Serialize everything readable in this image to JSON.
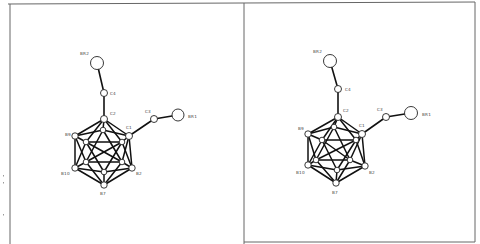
{
  "figure": {
    "type": "stereo-pair ORTEP molecular structure",
    "molecule": "bis(bromomethyl) ortho-carborane",
    "colors": {
      "bond": "#111111",
      "atom_fill": "#ffffff",
      "atom_stroke": "#222222",
      "frame": "#666666",
      "label": "#444444"
    }
  },
  "frame": {
    "top": [
      [
        8,
        4
      ],
      [
        475,
        2
      ]
    ],
    "left": [
      [
        10,
        4
      ],
      [
        10,
        244
      ]
    ],
    "divider": [
      [
        244,
        3
      ],
      [
        244,
        244
      ]
    ],
    "right": [
      [
        475,
        2
      ],
      [
        475,
        242
      ]
    ],
    "bottom_right": [
      [
        244,
        242
      ],
      [
        475,
        242
      ]
    ]
  },
  "margin_marks": [
    [
      3,
      175
    ],
    [
      3,
      182
    ],
    [
      3,
      214
    ]
  ],
  "panels": [
    {
      "name": "left-view",
      "atoms": [
        {
          "id": "BR2",
          "x": 97,
          "y": 63,
          "r": 6.5,
          "label": "BR2",
          "lx": 80,
          "ly": 55
        },
        {
          "id": "C4",
          "x": 104,
          "y": 93,
          "r": 3.5,
          "label": "C4",
          "lx": 110,
          "ly": 95
        },
        {
          "id": "C2",
          "x": 104,
          "y": 119,
          "r": 3.5,
          "label": "C2",
          "lx": 110,
          "ly": 115
        },
        {
          "id": "C3",
          "x": 154,
          "y": 119,
          "r": 3.5,
          "label": "C3",
          "lx": 145,
          "ly": 113
        },
        {
          "id": "BR1",
          "x": 178,
          "y": 115,
          "r": 6.0,
          "label": "BR1",
          "lx": 188,
          "ly": 118
        },
        {
          "id": "C1",
          "x": 129,
          "y": 136,
          "r": 3.5,
          "label": "C1",
          "lx": 126,
          "ly": 129
        },
        {
          "id": "B9",
          "x": 75,
          "y": 136,
          "r": 3.2,
          "label": "B9",
          "lx": 65,
          "ly": 136
        },
        {
          "id": "B10",
          "x": 75,
          "y": 168,
          "r": 3.2,
          "label": "B10",
          "lx": 61,
          "ly": 175
        },
        {
          "id": "B2",
          "x": 132,
          "y": 168,
          "r": 3.2,
          "label": "B2",
          "lx": 136,
          "ly": 175
        },
        {
          "id": "B7",
          "x": 104,
          "y": 185,
          "r": 3.2,
          "label": "B7",
          "lx": 100,
          "ly": 195
        },
        {
          "id": "i1",
          "x": 103,
          "y": 130,
          "r": 2.8,
          "label": "",
          "lx": 0,
          "ly": 0
        },
        {
          "id": "i2",
          "x": 86,
          "y": 142,
          "r": 2.8,
          "label": "",
          "lx": 0,
          "ly": 0
        },
        {
          "id": "i3",
          "x": 122,
          "y": 142,
          "r": 2.8,
          "label": "",
          "lx": 0,
          "ly": 0
        },
        {
          "id": "i4",
          "x": 86,
          "y": 162,
          "r": 2.8,
          "label": "",
          "lx": 0,
          "ly": 0
        },
        {
          "id": "i5",
          "x": 122,
          "y": 162,
          "r": 2.8,
          "label": "",
          "lx": 0,
          "ly": 0
        },
        {
          "id": "i6",
          "x": 104,
          "y": 172,
          "r": 2.8,
          "label": "",
          "lx": 0,
          "ly": 0
        }
      ]
    },
    {
      "name": "right-view",
      "atoms": [
        {
          "id": "BR2",
          "x": 330,
          "y": 61,
          "r": 6.5,
          "label": "BR2",
          "lx": 313,
          "ly": 53
        },
        {
          "id": "C4",
          "x": 338,
          "y": 89,
          "r": 3.5,
          "label": "C4",
          "lx": 345,
          "ly": 91
        },
        {
          "id": "C2",
          "x": 338,
          "y": 117,
          "r": 3.5,
          "label": "C2",
          "lx": 343,
          "ly": 112
        },
        {
          "id": "C3",
          "x": 386,
          "y": 117,
          "r": 3.5,
          "label": "C3",
          "lx": 377,
          "ly": 111
        },
        {
          "id": "BR1",
          "x": 411,
          "y": 113,
          "r": 6.5,
          "label": "BR1",
          "lx": 422,
          "ly": 116
        },
        {
          "id": "C1",
          "x": 362,
          "y": 134,
          "r": 3.5,
          "label": "C1",
          "lx": 359,
          "ly": 127
        },
        {
          "id": "B9",
          "x": 308,
          "y": 134,
          "r": 3.2,
          "label": "B9",
          "lx": 298,
          "ly": 130
        },
        {
          "id": "B10",
          "x": 308,
          "y": 165,
          "r": 3.2,
          "label": "B10",
          "lx": 296,
          "ly": 174
        },
        {
          "id": "B2",
          "x": 365,
          "y": 166,
          "r": 3.2,
          "label": "B2",
          "lx": 369,
          "ly": 174
        },
        {
          "id": "B7",
          "x": 336,
          "y": 183,
          "r": 3.2,
          "label": "B7",
          "lx": 332,
          "ly": 194
        },
        {
          "id": "i1",
          "x": 334,
          "y": 127,
          "r": 2.8,
          "label": "",
          "lx": 0,
          "ly": 0
        },
        {
          "id": "i2",
          "x": 322,
          "y": 140,
          "r": 2.8,
          "label": "",
          "lx": 0,
          "ly": 0
        },
        {
          "id": "i3",
          "x": 356,
          "y": 140,
          "r": 2.8,
          "label": "",
          "lx": 0,
          "ly": 0
        },
        {
          "id": "i4",
          "x": 316,
          "y": 160,
          "r": 2.8,
          "label": "",
          "lx": 0,
          "ly": 0
        },
        {
          "id": "i5",
          "x": 350,
          "y": 160,
          "r": 2.8,
          "label": "",
          "lx": 0,
          "ly": 0
        },
        {
          "id": "i6",
          "x": 337,
          "y": 170,
          "r": 2.8,
          "label": "",
          "lx": 0,
          "ly": 0
        }
      ]
    }
  ],
  "bonds": [
    [
      "BR2",
      "C4"
    ],
    [
      "C4",
      "C2"
    ],
    [
      "C1",
      "C3"
    ],
    [
      "C3",
      "BR1"
    ],
    [
      "C2",
      "B9"
    ],
    [
      "C2",
      "C1"
    ],
    [
      "C2",
      "i1"
    ],
    [
      "C2",
      "i2"
    ],
    [
      "C2",
      "i3"
    ],
    [
      "C1",
      "B2"
    ],
    [
      "C1",
      "i1"
    ],
    [
      "C1",
      "i3"
    ],
    [
      "C1",
      "i5"
    ],
    [
      "B9",
      "B10"
    ],
    [
      "B9",
      "i1"
    ],
    [
      "B9",
      "i2"
    ],
    [
      "B9",
      "i4"
    ],
    [
      "B10",
      "B7"
    ],
    [
      "B10",
      "i4"
    ],
    [
      "B10",
      "i6"
    ],
    [
      "B10",
      "i2"
    ],
    [
      "B2",
      "B7"
    ],
    [
      "B2",
      "i5"
    ],
    [
      "B2",
      "i6"
    ],
    [
      "B2",
      "i3"
    ],
    [
      "B7",
      "i4"
    ],
    [
      "B7",
      "i6"
    ],
    [
      "B7",
      "i5"
    ],
    [
      "i1",
      "i4"
    ],
    [
      "i1",
      "i5"
    ],
    [
      "i2",
      "i6"
    ],
    [
      "i3",
      "i6"
    ],
    [
      "i2",
      "i3"
    ],
    [
      "i4",
      "i5"
    ],
    [
      "i2",
      "i5"
    ],
    [
      "i3",
      "i4"
    ]
  ]
}
